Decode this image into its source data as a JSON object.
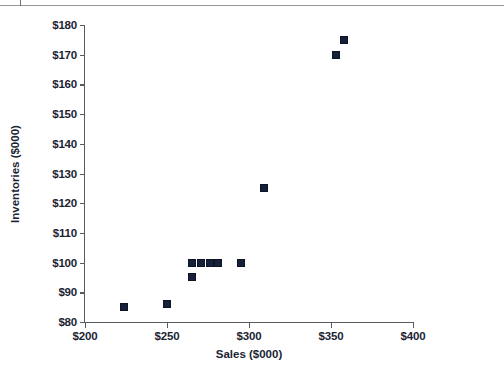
{
  "chart_data": {
    "type": "scatter",
    "title": "",
    "xlabel": "Sales ($000)",
    "ylabel": "Inventories ($000)",
    "xlim": [
      200,
      400
    ],
    "ylim": [
      80,
      180
    ],
    "xticks": [
      200,
      250,
      300,
      350,
      400
    ],
    "yticks": [
      80,
      90,
      100,
      110,
      120,
      130,
      140,
      150,
      160,
      170,
      180
    ],
    "xtick_labels": [
      "$200",
      "$250",
      "$300",
      "$350",
      "$400"
    ],
    "ytick_labels": [
      "$80",
      "$90",
      "$100",
      "$110",
      "$120",
      "$130",
      "$140",
      "$150",
      "$160",
      "$170",
      "$180"
    ],
    "grid": false,
    "legend": null,
    "marker": {
      "shape": "square",
      "color": "#16203a",
      "size": 8
    },
    "points": [
      {
        "x": 224,
        "y": 85
      },
      {
        "x": 250,
        "y": 86
      },
      {
        "x": 265,
        "y": 100
      },
      {
        "x": 265,
        "y": 95
      },
      {
        "x": 271,
        "y": 100
      },
      {
        "x": 276,
        "y": 100
      },
      {
        "x": 281,
        "y": 100
      },
      {
        "x": 295,
        "y": 100
      },
      {
        "x": 309,
        "y": 125
      },
      {
        "x": 353,
        "y": 170
      },
      {
        "x": 358,
        "y": 175
      }
    ],
    "series": [
      {
        "name": "Sales vs Inventories",
        "x": [
          224,
          250,
          265,
          265,
          271,
          276,
          281,
          295,
          309,
          353,
          358
        ],
        "values": [
          85,
          86,
          100,
          95,
          100,
          100,
          100,
          100,
          125,
          170,
          175
        ]
      }
    ]
  }
}
